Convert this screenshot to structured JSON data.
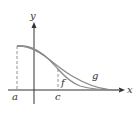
{
  "diagram": {
    "axes": {
      "x_label": "x",
      "y_label": "y"
    },
    "points": {
      "a_label": "a",
      "c_label": "c"
    },
    "curves": [
      {
        "name": "f",
        "label": "f",
        "color": "#8a8a8a"
      },
      {
        "name": "g",
        "label": "g",
        "color": "#8a8a8a"
      }
    ],
    "colors": {
      "axis": "#333333",
      "dashed": "#777777",
      "background": "#ffffff"
    }
  }
}
